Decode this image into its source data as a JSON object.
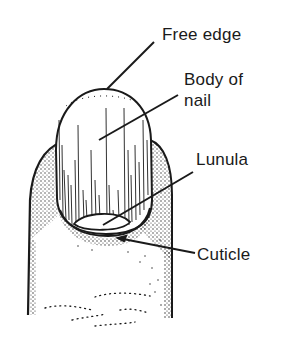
{
  "diagram": {
    "labels": {
      "free_edge": "Free edge",
      "body_of_nail_line1": "Body of",
      "body_of_nail_line2": "nail",
      "lunula": "Lunula",
      "cuticle": "Cuticle"
    },
    "colors": {
      "ink": "#1a1a1a",
      "background": "#ffffff"
    }
  }
}
